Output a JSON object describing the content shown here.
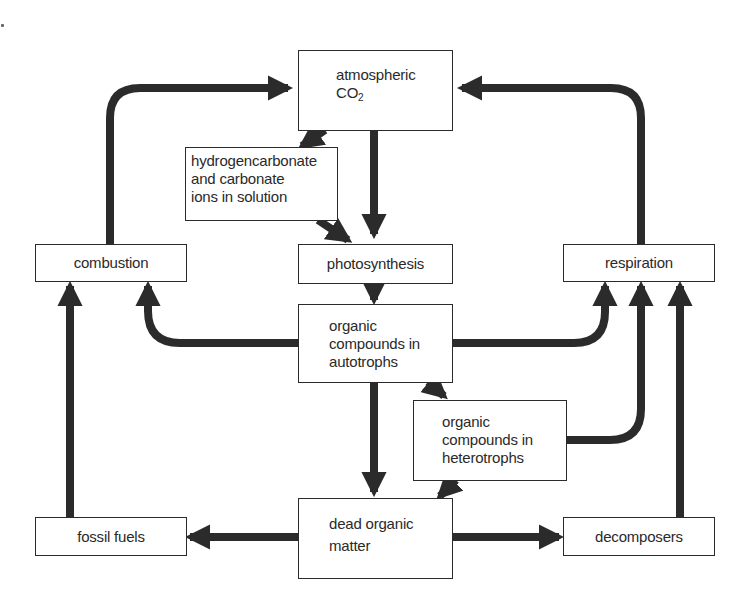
{
  "diagram": {
    "type": "flowchart",
    "colors": {
      "arrow": "#2b2b2b",
      "box_border": "#2b2b2b",
      "text": "#2a2a2a",
      "background": "#ffffff"
    },
    "nodes": {
      "atmospheric_co2": {
        "line1": "atmospheric",
        "line2_main": "CO",
        "line2_sub": "2"
      },
      "hydrogencarbonate": {
        "line1": "hydrogencarbonate",
        "line2": "and carbonate",
        "line3": "ions in solution"
      },
      "combustion": {
        "label": "combustion"
      },
      "photosynthesis": {
        "label": "photosynthesis"
      },
      "respiration": {
        "label": "respiration"
      },
      "autotrophs": {
        "line1": "organic",
        "line2": "compounds in",
        "line3": "autotrophs"
      },
      "heterotrophs": {
        "line1": "organic",
        "line2": "compounds in",
        "line3": "heterotrophs"
      },
      "fossil_fuels": {
        "label": "fossil fuels"
      },
      "dead_organic_matter": {
        "line1": "dead organic",
        "line2": "matter"
      },
      "decomposers": {
        "label": "decomposers"
      }
    },
    "edges": [
      {
        "from": "combustion",
        "to": "atmospheric CO2"
      },
      {
        "from": "respiration",
        "to": "atmospheric CO2"
      },
      {
        "from": "atmospheric CO2",
        "to": "hydrogencarbonate and carbonate ions in solution"
      },
      {
        "from": "atmospheric CO2",
        "to": "photosynthesis"
      },
      {
        "from": "hydrogencarbonate and carbonate ions in solution",
        "to": "photosynthesis"
      },
      {
        "from": "photosynthesis",
        "to": "organic compounds in autotrophs"
      },
      {
        "from": "organic compounds in autotrophs",
        "to": "combustion"
      },
      {
        "from": "organic compounds in autotrophs",
        "to": "respiration"
      },
      {
        "from": "organic compounds in autotrophs",
        "to": "organic compounds in heterotrophs"
      },
      {
        "from": "organic compounds in autotrophs",
        "to": "dead organic matter"
      },
      {
        "from": "organic compounds in heterotrophs",
        "to": "respiration"
      },
      {
        "from": "organic compounds in heterotrophs",
        "to": "dead organic matter"
      },
      {
        "from": "dead organic matter",
        "to": "fossil fuels"
      },
      {
        "from": "dead organic matter",
        "to": "decomposers"
      },
      {
        "from": "fossil fuels",
        "to": "combustion"
      },
      {
        "from": "decomposers",
        "to": "respiration"
      }
    ]
  }
}
